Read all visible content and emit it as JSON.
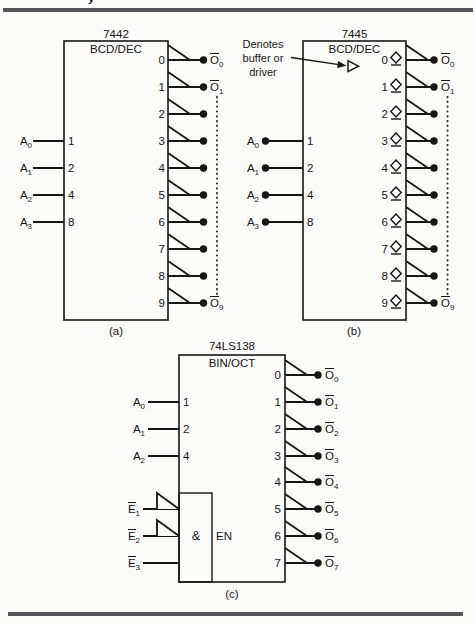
{
  "colors": {
    "ink": "#161616",
    "rule": "#55555a",
    "paper": "#fbfbf9"
  },
  "page_header": {
    "cropped_text": "y"
  },
  "diagram_a": {
    "chip": "7442",
    "function_label": "BCD/DEC",
    "caption": "(a)",
    "inputs": [
      {
        "base": "A",
        "sub": "0",
        "pin": "1"
      },
      {
        "base": "A",
        "sub": "1",
        "pin": "2"
      },
      {
        "base": "A",
        "sub": "2",
        "pin": "4"
      },
      {
        "base": "A",
        "sub": "3",
        "pin": "8"
      }
    ],
    "outputs": [
      {
        "num": "0",
        "label_base": "O",
        "label_sub": "0"
      },
      {
        "num": "1",
        "label_base": "O",
        "label_sub": "1"
      },
      {
        "num": "2"
      },
      {
        "num": "3"
      },
      {
        "num": "4"
      },
      {
        "num": "5"
      },
      {
        "num": "6"
      },
      {
        "num": "7"
      },
      {
        "num": "8"
      },
      {
        "num": "9",
        "label_base": "O",
        "label_sub": "9"
      }
    ]
  },
  "diagram_b": {
    "chip": "7445",
    "function_label": "BCD/DEC",
    "caption": "(b)",
    "note_lines": [
      "Denotes",
      "buffer or",
      "driver"
    ],
    "inputs": [
      {
        "base": "A",
        "sub": "0",
        "pin": "1"
      },
      {
        "base": "A",
        "sub": "1",
        "pin": "2"
      },
      {
        "base": "A",
        "sub": "2",
        "pin": "4"
      },
      {
        "base": "A",
        "sub": "3",
        "pin": "8"
      }
    ],
    "outputs": [
      {
        "num": "0",
        "label_base": "O",
        "label_sub": "0"
      },
      {
        "num": "1",
        "label_base": "O",
        "label_sub": "1"
      },
      {
        "num": "2"
      },
      {
        "num": "3"
      },
      {
        "num": "4"
      },
      {
        "num": "5"
      },
      {
        "num": "6"
      },
      {
        "num": "7"
      },
      {
        "num": "8"
      },
      {
        "num": "9",
        "label_base": "O",
        "label_sub": "9"
      }
    ]
  },
  "diagram_c": {
    "chip": "74LS138",
    "function_label": "BIN/OCT",
    "caption": "(c)",
    "and_label": "&",
    "en_label": "EN",
    "inputs": [
      {
        "base": "A",
        "sub": "0",
        "pin": "1"
      },
      {
        "base": "A",
        "sub": "1",
        "pin": "2"
      },
      {
        "base": "A",
        "sub": "2",
        "pin": "4"
      }
    ],
    "enables": [
      {
        "base": "E",
        "sub": "1"
      },
      {
        "base": "E",
        "sub": "2"
      },
      {
        "base": "E",
        "sub": "3"
      }
    ],
    "outputs": [
      {
        "num": "0",
        "label_base": "O",
        "label_sub": "0"
      },
      {
        "num": "1",
        "label_base": "O",
        "label_sub": "1"
      },
      {
        "num": "2",
        "label_base": "O",
        "label_sub": "2"
      },
      {
        "num": "3",
        "label_base": "O",
        "label_sub": "3"
      },
      {
        "num": "4",
        "label_base": "O",
        "label_sub": "4"
      },
      {
        "num": "5",
        "label_base": "O",
        "label_sub": "5"
      },
      {
        "num": "6",
        "label_base": "O",
        "label_sub": "6"
      },
      {
        "num": "7",
        "label_base": "O",
        "label_sub": "7"
      }
    ]
  }
}
